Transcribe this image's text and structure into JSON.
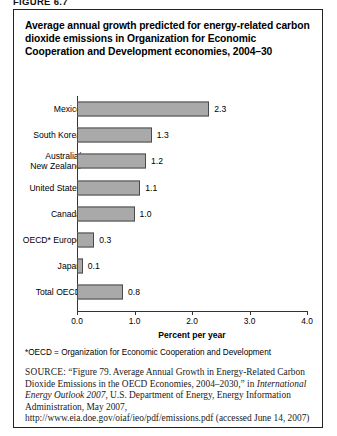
{
  "figure_label": "FIGURE 6.7",
  "title": "Average annual growth predicted for energy-related carbon dioxide emissions in Organization for Economic Cooperation and Development economies, 2004–30",
  "footnote": "*OECD = Organization for Economic Cooperation and Development",
  "source": {
    "label": "SOURCE:",
    "text_1": " “Figure 79. Average Annual Growth in Energy-Related Carbon Dioxide Emissions in the OECD Economies, 2004–2030,” in ",
    "italic_1": "International Energy Outlook 2007",
    "text_2": ", U.S. Department of Energy, Energy Information Administration, May 2007, http://www.eia.doe.gov/oiaf/ieo/pdf/emissions.pdf (accessed June 14, 2007)"
  },
  "colors": {
    "bar_fill": "#a9a9a9",
    "bar_border": "#4a4a4a",
    "axis": "#333333",
    "frame": "#222222"
  },
  "chart_data": {
    "type": "bar",
    "orientation": "horizontal",
    "title": "Average annual growth predicted for energy-related carbon dioxide emissions in Organization for Economic Cooperation and Development economies, 2004–30",
    "categories": [
      "Mexico",
      "South Korea",
      "Australia/\nNew Zealand",
      "United States",
      "Canada",
      "OECD* Europe",
      "Japan",
      "Total OECD"
    ],
    "values": [
      2.3,
      1.3,
      1.2,
      1.1,
      1.0,
      0.3,
      0.1,
      0.8
    ],
    "value_labels": [
      "2.3",
      "1.3",
      "1.2",
      "1.1",
      "1.0",
      "0.3",
      "0.1",
      "0.8"
    ],
    "xlabel": "Percent per year",
    "ylabel": "",
    "xlim": [
      0.0,
      4.0
    ],
    "xticks": [
      0.0,
      1.0,
      2.0,
      3.0,
      4.0
    ],
    "xtick_labels": [
      "0.0",
      "1.0",
      "2.0",
      "3.0",
      "4.0"
    ],
    "grid": false,
    "legend": false
  }
}
